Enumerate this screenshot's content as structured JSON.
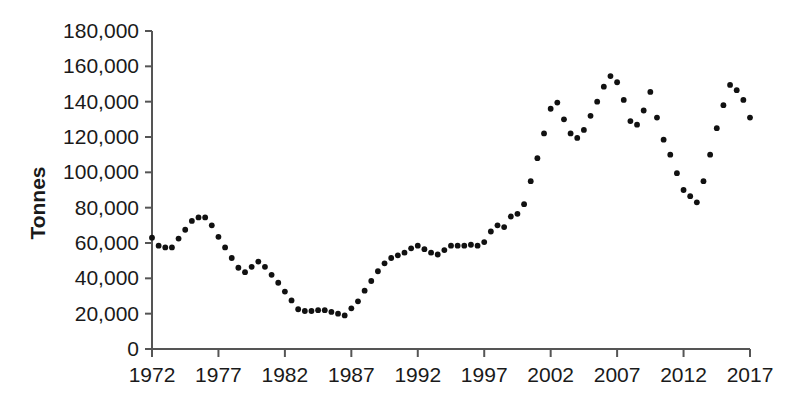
{
  "chart_data": {
    "type": "scatter",
    "title": "",
    "subtitle": "",
    "xlabel": "",
    "ylabel": "Tonnes",
    "xlim": [
      1972,
      2017
    ],
    "ylim": [
      0,
      180000
    ],
    "grid": false,
    "legend": null,
    "marker": "dot",
    "marker_color": "#111111",
    "axis_color": "#555555",
    "text_color": "#1a1a1a",
    "background": "#ffffff",
    "y_ticks": [
      0,
      20000,
      40000,
      60000,
      80000,
      100000,
      120000,
      140000,
      160000,
      180000
    ],
    "y_tick_labels": [
      "0",
      "20,000",
      "40,000",
      "60,000",
      "80,000",
      "100,000",
      "120,000",
      "140,000",
      "160,000",
      "180,000"
    ],
    "x_ticks": [
      1972,
      1977,
      1982,
      1987,
      1992,
      1997,
      2002,
      2007,
      2012,
      2017
    ],
    "x_tick_labels": [
      "1972",
      "1977",
      "1982",
      "1987",
      "1992",
      "1997",
      "2002",
      "2007",
      "2012",
      "2017"
    ],
    "sampling": "semi-annual",
    "x": [
      1972.0,
      1972.5,
      1973.0,
      1973.5,
      1974.0,
      1974.5,
      1975.0,
      1975.5,
      1976.0,
      1976.5,
      1977.0,
      1977.5,
      1978.0,
      1978.5,
      1979.0,
      1979.5,
      1980.0,
      1980.5,
      1981.0,
      1981.5,
      1982.0,
      1982.5,
      1983.0,
      1983.5,
      1984.0,
      1984.5,
      1985.0,
      1985.5,
      1986.0,
      1986.5,
      1987.0,
      1987.5,
      1988.0,
      1988.5,
      1989.0,
      1989.5,
      1990.0,
      1990.5,
      1991.0,
      1991.5,
      1992.0,
      1992.5,
      1993.0,
      1993.5,
      1994.0,
      1994.5,
      1995.0,
      1995.5,
      1996.0,
      1996.5,
      1997.0,
      1997.5,
      1998.0,
      1998.5,
      1999.0,
      1999.5,
      2000.0,
      2000.5,
      2001.0,
      2001.5,
      2002.0,
      2002.5,
      2003.0,
      2003.5,
      2004.0,
      2004.5,
      2005.0,
      2005.5,
      2006.0,
      2006.5,
      2007.0,
      2007.5,
      2008.0,
      2008.5,
      2009.0,
      2009.5,
      2010.0,
      2010.5,
      2011.0,
      2011.5,
      2012.0,
      2012.5,
      2013.0,
      2013.5,
      2014.0,
      2014.5,
      2015.0,
      2015.5,
      2016.0,
      2016.5,
      2017.0
    ],
    "values": [
      63000,
      58500,
      57500,
      57500,
      62500,
      67500,
      72500,
      74500,
      74500,
      70000,
      63500,
      57500,
      51500,
      46000,
      43500,
      46500,
      49500,
      46500,
      42000,
      37500,
      32500,
      27500,
      22500,
      21500,
      21500,
      22000,
      22000,
      21000,
      20000,
      19000,
      23000,
      27000,
      33000,
      38500,
      44000,
      48500,
      51500,
      53000,
      54500,
      57000,
      58500,
      56500,
      54500,
      53500,
      56000,
      58500,
      58500,
      58500,
      59000,
      58500,
      60500,
      66500,
      70000,
      69000,
      75000,
      76500,
      82000,
      95000,
      108000,
      122000,
      136000,
      139500,
      130000,
      122000,
      119500,
      124000,
      132000,
      140000,
      148500,
      154500,
      151000,
      141000,
      129000,
      127000,
      135000,
      145500,
      131000,
      118500,
      110000,
      99500,
      90000,
      86500,
      83000,
      95000,
      110000,
      125000,
      138000,
      149500,
      146500,
      141000,
      131000
    ]
  },
  "axis": {
    "ylabel_text": "Tonnes"
  }
}
